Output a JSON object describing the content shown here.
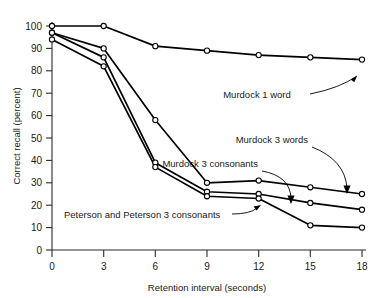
{
  "chart_data": {
    "type": "line",
    "title": "",
    "xlabel": "Retention interval (seconds)",
    "ylabel": "Correct recall (percent)",
    "x": [
      0,
      3,
      6,
      9,
      12,
      15,
      18
    ],
    "xlim": [
      0,
      18
    ],
    "ylim": [
      0,
      100
    ],
    "xticks": [
      "0",
      "3",
      "6",
      "9",
      "12",
      "15",
      "18"
    ],
    "yticks": [
      "0",
      "10",
      "20",
      "30",
      "40",
      "50",
      "60",
      "70",
      "80",
      "90",
      "100"
    ],
    "grid": false,
    "legend_position": "inline-annotations",
    "marker": "open-circle",
    "series": [
      {
        "name": "Murdock 1 word",
        "values": [
          100,
          100,
          91,
          89,
          87,
          86,
          85
        ]
      },
      {
        "name": "Murdock 3 words",
        "values": [
          97,
          90,
          58,
          30,
          31,
          28,
          25
        ]
      },
      {
        "name": "Murdock 3 consonants",
        "values": [
          97,
          86,
          39,
          26,
          25,
          21,
          18
        ]
      },
      {
        "name": "Peterson and Peterson 3 consonants",
        "values": [
          94,
          82,
          37,
          24,
          23,
          11,
          10
        ]
      }
    ],
    "annotations": [
      {
        "text": "Murdock 1 word",
        "anchor_series": "Murdock 1 word",
        "points_to_x": 18
      },
      {
        "text": "Murdock 3 words",
        "anchor_series": "Murdock 3 words",
        "points_to_x": 18
      },
      {
        "text": "Murdock 3 consonants",
        "anchor_series": "Murdock 3 consonants",
        "points_to_x": 15
      },
      {
        "text": "Peterson and Peterson 3 consonants",
        "anchor_series": "Peterson and Peterson 3 consonants",
        "points_to_x": 12
      }
    ]
  },
  "axes": {
    "x_title": "Retention interval (seconds)",
    "y_title": "Correct recall (percent)",
    "x_tick_labels": [
      "0",
      "3",
      "6",
      "9",
      "12",
      "15",
      "18"
    ],
    "y_tick_labels": [
      "0",
      "10",
      "20",
      "30",
      "40",
      "50",
      "60",
      "70",
      "80",
      "90",
      "100"
    ]
  },
  "annotations": {
    "murdock_1_word": "Murdock 1 word",
    "murdock_3_words": "Murdock 3 words",
    "murdock_3_consonants": "Murdock 3 consonants",
    "peterson_3_consonants": "Peterson and Peterson 3 consonants"
  },
  "colors": {
    "line": "#000000",
    "axis": "#2b2b2b",
    "marker_fill": "#ffffff",
    "background": "#ffffff"
  }
}
